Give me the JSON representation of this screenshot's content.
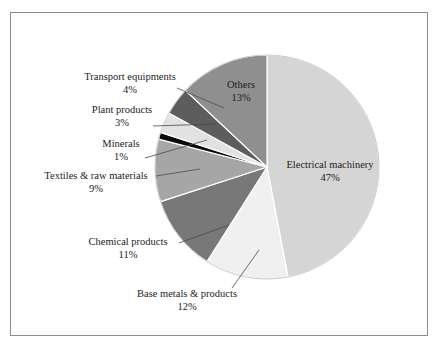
{
  "figure": {
    "border_color": "#8d8d8d",
    "background": "#ffffff"
  },
  "chart_data": {
    "type": "pie",
    "title": "",
    "subtitle": "",
    "xlabel": "",
    "ylabel": "",
    "legend_position": "none",
    "grid": false,
    "value_unit": "%",
    "start_angle_deg": 0,
    "direction": "clockwise",
    "total": 100,
    "categories": [
      "Electrical machinery",
      "Base metals & products",
      "Chemical products",
      "Textiles & raw materials",
      "Minerals",
      "Plant products",
      "Transport equipments",
      "Others"
    ],
    "values": [
      47,
      12,
      11,
      9,
      1,
      3,
      4,
      13
    ],
    "slices": [
      {
        "name": "Electrical machinery",
        "label": "Electrical machinery",
        "value": 47,
        "value_text": "47%",
        "color": "#d5d5d5",
        "label_placement": "inside",
        "label_x": 330,
        "label_y": 168,
        "value_x": 330,
        "value_y": 181
      },
      {
        "name": "Base metals & products",
        "label": "Base metals & products",
        "value": 12,
        "value_text": "12%",
        "color": "#f0f0f0",
        "label_placement": "outside",
        "label_x": 187,
        "label_y": 297,
        "value_x": 187,
        "value_y": 310,
        "leader": {
          "x1": 259,
          "y1": 250,
          "x2": 232,
          "y2": 288
        }
      },
      {
        "name": "Chemical products",
        "label": "Chemical products",
        "value": 11,
        "value_text": "11%",
        "color": "#787878",
        "label_placement": "outside",
        "label_x": 128,
        "label_y": 245,
        "value_x": 128,
        "value_y": 258,
        "leader": {
          "x1": 229,
          "y1": 225,
          "x2": 179,
          "y2": 243
        }
      },
      {
        "name": "Textiles & raw materials",
        "label": "Textiles & raw materials",
        "value": 9,
        "value_text": "9%",
        "color": "#a6a6a6",
        "label_placement": "outside",
        "label_x": 96,
        "label_y": 179,
        "value_x": 96,
        "value_y": 192,
        "leader": {
          "x1": 200,
          "y1": 169,
          "x2": 156,
          "y2": 176
        }
      },
      {
        "name": "Minerals",
        "label": "Minerals",
        "value": 1,
        "value_text": "1%",
        "color": "#0b0b0b",
        "label_placement": "outside",
        "label_x": 121,
        "label_y": 147,
        "value_x": 121,
        "value_y": 160,
        "leader": {
          "x1": 207,
          "y1": 140,
          "x2": 145,
          "y2": 158
        }
      },
      {
        "name": "Plant products",
        "label": "Plant products",
        "value": 3,
        "value_text": "3%",
        "color": "#e2e2e2",
        "label_placement": "outside",
        "label_x": 122,
        "label_y": 113,
        "value_x": 122,
        "value_y": 126,
        "leader": {
          "x1": 215,
          "y1": 124,
          "x2": 153,
          "y2": 126
        }
      },
      {
        "name": "Transport equipments",
        "label": "Transport equipments",
        "value": 4,
        "value_text": "4%",
        "color": "#5d5d5d",
        "label_placement": "outside",
        "label_x": 130,
        "label_y": 80,
        "value_x": 130,
        "value_y": 93,
        "leader": {
          "x1": 224,
          "y1": 108,
          "x2": 177,
          "y2": 88
        }
      },
      {
        "name": "Others",
        "label": "Others",
        "value": 13,
        "value_text": "13%",
        "color": "#8f8f8f",
        "label_placement": "inside",
        "label_x": 241,
        "label_y": 88,
        "value_x": 241,
        "value_y": 101
      }
    ],
    "geometry": {
      "center_x": 267,
      "center_y": 167,
      "radius": 112
    },
    "style": {
      "slice_separator_color": "#ffffff",
      "slice_separator_width": 1.2,
      "leader_line_color": "#4a4a4a",
      "label_font_size": 10.5,
      "inside_label_font_size": 10.5
    }
  }
}
